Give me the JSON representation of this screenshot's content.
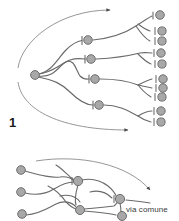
{
  "figure": {
    "panel_label": "1",
    "caption": "via comune",
    "colors": {
      "node_fill": "#a8a8a8",
      "node_stroke": "#6e6e6e",
      "branch_stroke": "#6a6a6a",
      "envelope_stroke": "#8a8a8a",
      "arrow_stroke": "#4a4a4a",
      "label_color": "#1b1b1b",
      "caption_color": "#3a3a3a",
      "background": "#ffffff"
    },
    "geometry": {
      "width": 179,
      "height": 221,
      "node_radius": 4.2,
      "terminal_radius": 4.0
    }
  },
  "top_panel": {
    "name": "divergent-branching-tree",
    "root_node": {
      "id": "root",
      "x": 35,
      "y": 75
    },
    "level1_nodes": [
      {
        "id": "b1",
        "x": 88,
        "y": 40
      },
      {
        "id": "b2",
        "x": 91,
        "y": 59
      },
      {
        "id": "b3",
        "x": 95,
        "y": 79
      },
      {
        "id": "b4",
        "x": 99,
        "y": 105
      }
    ],
    "terminal_nodes": [
      {
        "id": "t1",
        "x": 160,
        "y": 15
      },
      {
        "id": "t2",
        "x": 162,
        "y": 31
      },
      {
        "id": "t3",
        "x": 162,
        "y": 41
      },
      {
        "id": "t4",
        "x": 161,
        "y": 53
      },
      {
        "id": "t5",
        "x": 162,
        "y": 64
      },
      {
        "id": "t6",
        "x": 163,
        "y": 79
      },
      {
        "id": "t7",
        "x": 163,
        "y": 88
      },
      {
        "id": "t8",
        "x": 162,
        "y": 97
      },
      {
        "id": "t9",
        "x": 161,
        "y": 111
      },
      {
        "id": "t10",
        "x": 161,
        "y": 122
      }
    ],
    "branch_edges": [
      {
        "from": "root",
        "to": "b1"
      },
      {
        "from": "root",
        "to": "b2"
      },
      {
        "from": "root",
        "to": "b3"
      },
      {
        "from": "root",
        "to": "b4"
      },
      {
        "from": "b1",
        "to": "t1"
      },
      {
        "from": "b1",
        "to": "t2"
      },
      {
        "from": "b1",
        "to": "t3"
      },
      {
        "from": "b2",
        "to": "t4"
      },
      {
        "from": "b2",
        "to": "t5"
      },
      {
        "from": "b3",
        "to": "t6"
      },
      {
        "from": "b3",
        "to": "t7"
      },
      {
        "from": "b3",
        "to": "t8"
      },
      {
        "from": "b4",
        "to": "t9"
      },
      {
        "from": "b4",
        "to": "t10"
      }
    ],
    "envelope_arrows": [
      {
        "id": "upper-envelope-arrow",
        "direction": "rightward"
      },
      {
        "id": "lower-envelope-arrow",
        "direction": "rightward"
      }
    ]
  },
  "bottom_panel": {
    "name": "convergent-common-pathway-network",
    "input_nodes": [
      {
        "id": "i1",
        "x": 21,
        "y": 170
      },
      {
        "id": "i2",
        "x": 21,
        "y": 192
      },
      {
        "id": "i3",
        "x": 22,
        "y": 214
      }
    ],
    "hub_nodes": [
      {
        "id": "h1",
        "x": 78,
        "y": 181
      },
      {
        "id": "h2",
        "x": 80,
        "y": 210
      },
      {
        "id": "h3",
        "x": 120,
        "y": 199
      },
      {
        "id": "h4",
        "x": 122,
        "y": 216
      }
    ],
    "convergence_arrow": {
      "id": "common-pathway-arrow",
      "direction": "rightward"
    }
  }
}
